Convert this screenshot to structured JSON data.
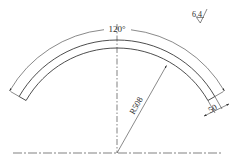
{
  "drawing": {
    "title": "Arc segment part drawing",
    "angle_dimension": "120°",
    "radius_dimension": "R508",
    "width_dimension": "50",
    "surface_roughness": "6.4",
    "line_color": "#3a3a3a",
    "background": "#ffffff",
    "geometry": {
      "center": [
        117,
        153
      ],
      "inner_radius_px": 105,
      "outer_radius_px": 113,
      "dimension_arc_radius_px": 124,
      "arc_span_deg": 120
    }
  }
}
